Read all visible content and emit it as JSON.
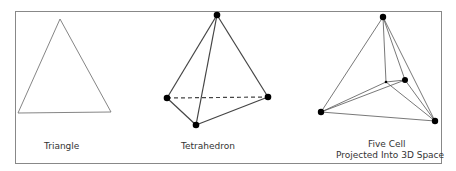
{
  "figures": [
    {
      "id": "triangle",
      "label": "Triangle"
    },
    {
      "id": "tetrahedron",
      "label": "Tetrahedron"
    },
    {
      "id": "five-cell",
      "label_line1": "Five Cell",
      "label_line2": "Projected Into 3D Space"
    }
  ],
  "colors": {
    "stroke": "#555555",
    "vertex": "#000000",
    "border": "#888888"
  }
}
